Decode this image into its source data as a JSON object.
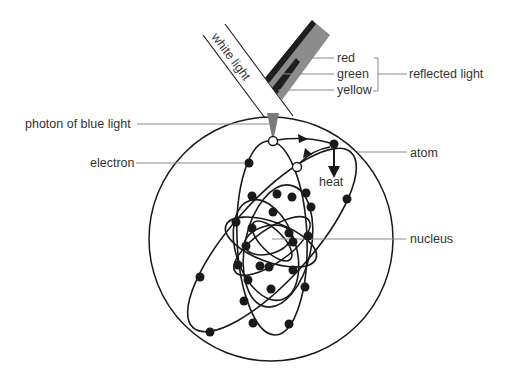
{
  "diagram": {
    "labels": {
      "white_light": "white light",
      "red": "red",
      "green": "green",
      "yellow": "yellow",
      "reflected_light": "reflected light",
      "photon": "photon of blue light",
      "electron": "electron",
      "atom": "atom",
      "heat": "heat",
      "nucleus": "nucleus"
    },
    "colors": {
      "line": "#1a1a1a",
      "leader": "#8a8a8a",
      "text": "#333333",
      "reflected_beam": "#8c8c8c",
      "reflected_stripe": "#1e1e1e",
      "photon_fill": "#7a7a7a",
      "background": "#ffffff"
    }
  }
}
